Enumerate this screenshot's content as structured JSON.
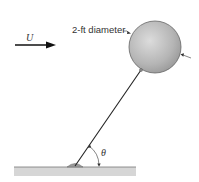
{
  "diagram": {
    "flow_label": "U",
    "diameter_label": "2-ft diameter",
    "angle_label": "θ",
    "colors": {
      "ball_fill": "#b8b8b8",
      "ball_stroke": "#555555",
      "ground_fill": "#d4d4d4",
      "ground_line": "#777777",
      "line": "#222222",
      "hinge_fill": "#9a9a9a"
    }
  }
}
